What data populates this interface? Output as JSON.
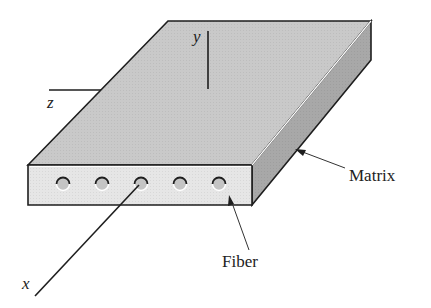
{
  "figure": {
    "axes": {
      "x_label": "x",
      "y_label": "y",
      "z_label": "z"
    },
    "callouts": {
      "matrix_label": "Matrix",
      "fiber_label": "Fiber"
    },
    "fiber_count": 5,
    "colors": {
      "top_face": "#c9c9c9",
      "front_face": "#e6e6e6",
      "side_face": "#a8a8a8",
      "fiber": "#c4c4c4",
      "outline": "#1e1e1e"
    }
  }
}
